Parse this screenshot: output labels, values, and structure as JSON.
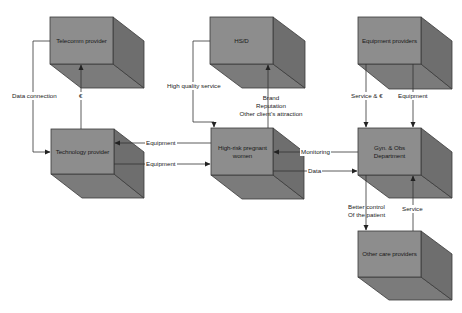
{
  "colors": {
    "front": "#8c8c8c",
    "side": "#6f6f6f",
    "bottom": "#7a7a7a",
    "edge": "#3a3a3a",
    "line": "#333333",
    "background": "#ffffff"
  },
  "nodes": {
    "telecomm": {
      "label": "Telecomm provider"
    },
    "hsd": {
      "label": "HS/D"
    },
    "equipment_providers": {
      "label": "Equipment providers"
    },
    "technology": {
      "label": "Technology provider"
    },
    "women": {
      "label": "High-risk pregnant women"
    },
    "gyn": {
      "label": "Gyn. & Obs Department"
    },
    "other_care": {
      "label": "Other care providers"
    }
  },
  "edges": {
    "data_connection": {
      "label": "Data connection",
      "from": "telecomm",
      "to": "technology"
    },
    "euro_payment": {
      "label": "€",
      "from": "technology",
      "to": "telecomm"
    },
    "high_quality_service": {
      "label": "High quality service",
      "from": "hsd",
      "to": "women"
    },
    "brand": {
      "label": "Brand\nReputation\nOther client's attraction",
      "from": "women",
      "to": "hsd"
    },
    "service_euro": {
      "label": "Service & €",
      "from": "equipment_providers",
      "to": "gyn"
    },
    "equipment_supply": {
      "label": "Equipment",
      "from": "equipment_providers",
      "to": "gyn"
    },
    "equipment_to_tech": {
      "label": "Equipment",
      "from": "women",
      "to": "technology"
    },
    "equipment_to_women": {
      "label": "Equipment",
      "from": "technology",
      "to": "women"
    },
    "monitoring": {
      "label": "Monitoring",
      "from": "gyn",
      "to": "women"
    },
    "data": {
      "label": "Data",
      "from": "women",
      "to": "gyn"
    },
    "better_control": {
      "label": "Better control\nOf the patient",
      "from": "gyn",
      "to": "other_care"
    },
    "service": {
      "label": "Service",
      "from": "other_care",
      "to": "gyn"
    }
  }
}
